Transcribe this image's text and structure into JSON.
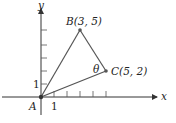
{
  "diagram": {
    "type": "coordinate-geometry-triangle",
    "axes": {
      "x_label": "x",
      "y_label": "y",
      "x_tick_label": "1",
      "y_tick_label": "1",
      "x_ticks": 5,
      "y_ticks": 5
    },
    "points": [
      {
        "id": "A",
        "label": "A",
        "coords": [
          0,
          0
        ]
      },
      {
        "id": "B",
        "label": "B(3, 5)",
        "coords": [
          3,
          5
        ]
      },
      {
        "id": "C",
        "label": "C(5, 2)",
        "coords": [
          5,
          2
        ]
      }
    ],
    "segments": [
      [
        "A",
        "B"
      ],
      [
        "B",
        "C"
      ],
      [
        "A",
        "C"
      ]
    ],
    "angle_label": "θ",
    "angle_at": "C",
    "colors": {
      "triangle": "#555555",
      "axes": "#333333",
      "points": "#444444"
    }
  }
}
